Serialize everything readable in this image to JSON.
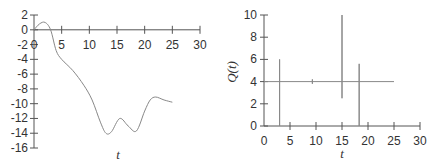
{
  "chart_data": [
    {
      "type": "line",
      "title": "",
      "xlabel": "t",
      "ylabel": "",
      "xlim": [
        0,
        30
      ],
      "ylim": [
        -16,
        2
      ],
      "x_ticks": [
        0,
        5,
        10,
        15,
        20,
        25,
        30
      ],
      "y_ticks": [
        2,
        0,
        -2,
        -4,
        -6,
        -8,
        -10,
        -12,
        -14,
        -16
      ],
      "grid": false,
      "series": [
        {
          "name": "curve",
          "color": "#888888",
          "x": [
            0,
            1,
            2,
            3,
            4,
            5,
            7,
            9,
            10.5,
            12,
            13,
            14,
            15.5,
            17,
            18.5,
            20,
            21,
            22,
            23.5,
            25
          ],
          "y": [
            0,
            0.8,
            1,
            0,
            -2.8,
            -4,
            -5.5,
            -7.5,
            -9.5,
            -12.5,
            -14,
            -13.8,
            -12,
            -13,
            -13.7,
            -11,
            -9.5,
            -9.1,
            -9.5,
            -9.8
          ]
        }
      ]
    },
    {
      "type": "line",
      "title": "",
      "xlabel": "t",
      "ylabel": "Q(t)",
      "xlim": [
        0,
        30
      ],
      "ylim": [
        0,
        10
      ],
      "x_ticks": [
        0,
        5,
        10,
        15,
        20,
        25,
        30
      ],
      "y_ticks": [
        0,
        2,
        4,
        6,
        8,
        10
      ],
      "grid": false,
      "series": [
        {
          "name": "Q(t)",
          "color": "#888888",
          "baseline": 4,
          "spikes": [
            {
              "t": 3.0,
              "max": 6.0,
              "min": 0
            },
            {
              "t": 9.3,
              "max": 4.2,
              "min": 3.8
            },
            {
              "t": 15.0,
              "max": 10.0,
              "min": 2.5
            },
            {
              "t": 18.3,
              "max": 5.6,
              "min": 0
            }
          ],
          "t_range": [
            0,
            25
          ]
        }
      ]
    }
  ],
  "left": {
    "xlabel": "t",
    "x_tick_labels": [
      "0",
      "5",
      "10",
      "15",
      "20",
      "25",
      "30"
    ],
    "y_tick_labels": [
      "2",
      "0",
      "-2",
      "-4",
      "-6",
      "-8",
      "-10",
      "-12",
      "-14",
      "-16"
    ]
  },
  "right": {
    "xlabel": "t",
    "ylabel": "Q(t)",
    "x_tick_labels": [
      "0",
      "5",
      "10",
      "15",
      "20",
      "25",
      "30"
    ],
    "y_tick_labels": [
      "0",
      "2",
      "4",
      "6",
      "8",
      "10"
    ]
  }
}
